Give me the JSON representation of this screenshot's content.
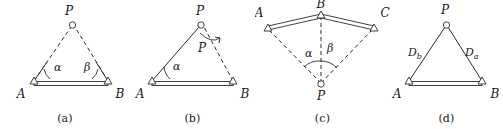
{
  "figure": {
    "background_color": "#ffffff",
    "line_color": "#2b2b2b",
    "width": 503,
    "height": 129
  },
  "panels": [
    {
      "id": "a",
      "caption": "(a)",
      "points": [
        {
          "name": "P",
          "label": "P",
          "marker": "circle"
        },
        {
          "name": "A",
          "label": "A",
          "marker": "triangle"
        },
        {
          "name": "B",
          "label": "B",
          "marker": "triangle"
        }
      ],
      "angles": [
        {
          "name": "alpha",
          "label": "α",
          "at": "A"
        },
        {
          "name": "beta",
          "label": "β",
          "at": "B"
        }
      ],
      "edges": [
        {
          "from": "A",
          "to": "B",
          "style": "double-bar"
        },
        {
          "from": "A",
          "to": "P",
          "style": "dashed"
        },
        {
          "from": "B",
          "to": "P",
          "style": "dashed"
        }
      ]
    },
    {
      "id": "b",
      "caption": "(b)",
      "points": [
        {
          "name": "P",
          "label": "P",
          "marker": "circle"
        },
        {
          "name": "P2",
          "label": "P",
          "marker": "none"
        },
        {
          "name": "A",
          "label": "A",
          "marker": "triangle"
        },
        {
          "name": "B",
          "label": "B",
          "marker": "triangle"
        }
      ],
      "angles": [
        {
          "name": "alpha",
          "label": "α",
          "at": "A"
        }
      ],
      "edges": [
        {
          "from": "A",
          "to": "B",
          "style": "double-bar"
        },
        {
          "from": "A",
          "to": "P",
          "style": "solid"
        },
        {
          "from": "B",
          "to": "P",
          "style": "dashed"
        }
      ],
      "annotations": [
        {
          "name": "position-shift-arrow",
          "label": ""
        }
      ]
    },
    {
      "id": "c",
      "caption": "(c)",
      "points": [
        {
          "name": "A",
          "label": "A",
          "marker": "triangle"
        },
        {
          "name": "B",
          "label": "B",
          "marker": "triangle"
        },
        {
          "name": "C",
          "label": "C",
          "marker": "triangle"
        },
        {
          "name": "P",
          "label": "P",
          "marker": "circle"
        }
      ],
      "angles": [
        {
          "name": "alpha",
          "label": "α",
          "at": "P"
        },
        {
          "name": "beta",
          "label": "β",
          "at": "P"
        }
      ],
      "edges": [
        {
          "from": "A",
          "to": "B",
          "style": "double-bar"
        },
        {
          "from": "B",
          "to": "C",
          "style": "double-bar"
        },
        {
          "from": "P",
          "to": "A",
          "style": "dashed"
        },
        {
          "from": "P",
          "to": "B",
          "style": "dashed"
        },
        {
          "from": "P",
          "to": "C",
          "style": "dashed"
        }
      ]
    },
    {
      "id": "d",
      "caption": "(d)",
      "points": [
        {
          "name": "P",
          "label": "P",
          "marker": "circle"
        },
        {
          "name": "A",
          "label": "A",
          "marker": "triangle"
        },
        {
          "name": "B",
          "label": "B",
          "marker": "triangle"
        }
      ],
      "distances": [
        {
          "name": "Db",
          "base": "D",
          "subscript": "b",
          "side": "AP"
        },
        {
          "name": "Da",
          "base": "D",
          "subscript": "a",
          "side": "BP"
        }
      ],
      "edges": [
        {
          "from": "A",
          "to": "B",
          "style": "double-bar"
        },
        {
          "from": "A",
          "to": "P",
          "style": "solid"
        },
        {
          "from": "B",
          "to": "P",
          "style": "solid"
        }
      ]
    }
  ],
  "stray_marks": [
    {
      "name": "edge-artifact-b",
      "label": "B"
    }
  ]
}
